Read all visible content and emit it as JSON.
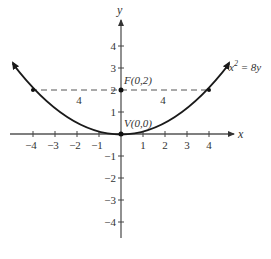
{
  "diagram": {
    "equation": "x² = 8y",
    "equation_base": "x",
    "equation_exp": "2",
    "equation_rest": " = 8y",
    "x_axis_label": "x",
    "y_axis_label": "y",
    "focus_label": "F(0,2)",
    "vertex_label": "V(0,0)",
    "left_distance_label": "4",
    "right_distance_label": "4",
    "x_ticks": [
      "−4",
      "−3",
      "−2",
      "−1",
      "1",
      "2",
      "3",
      "4"
    ],
    "y_ticks": [
      "4",
      "3",
      "2",
      "1",
      "−1",
      "−2",
      "−3",
      "−4"
    ],
    "colors": {
      "curve": "#1a1a1a",
      "axis": "#444444",
      "dashed": "#555555"
    }
  }
}
